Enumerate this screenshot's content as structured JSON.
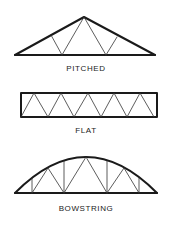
{
  "diagram": {
    "trusses": [
      {
        "id": "pitched",
        "label": "Pitched"
      },
      {
        "id": "flat",
        "label": "Flat"
      },
      {
        "id": "bowstring",
        "label": "Bowstring"
      }
    ]
  },
  "colors": {
    "line": "#1a1a1a",
    "background": "#ffffff"
  }
}
